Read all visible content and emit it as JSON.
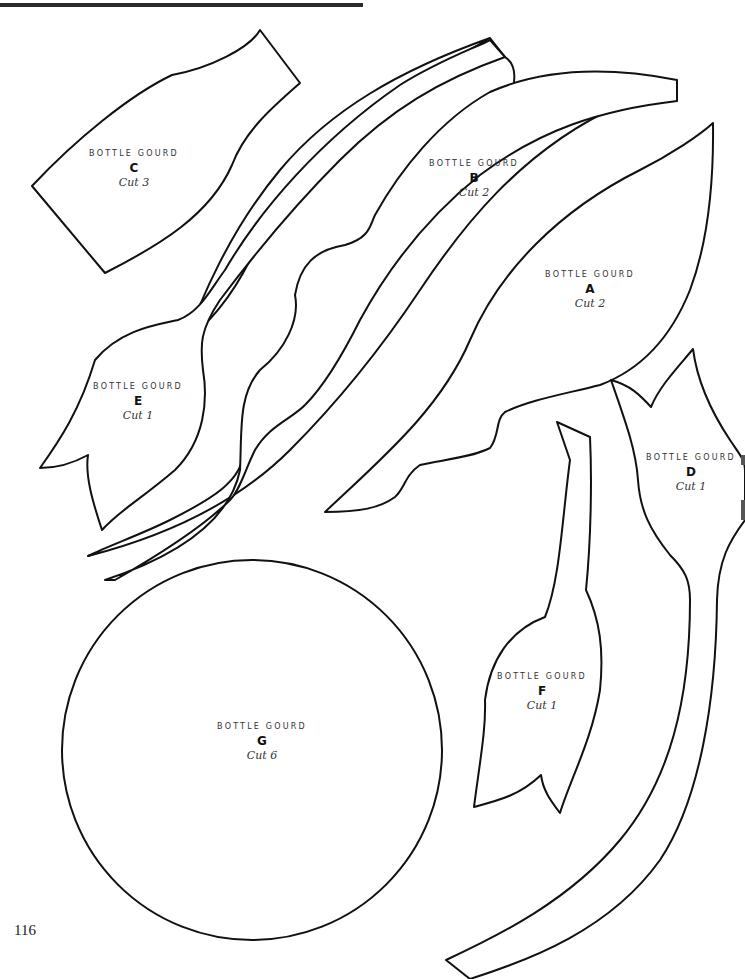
{
  "page": {
    "page_number": "116",
    "rule_color": "#2b2b2b",
    "line_color": "#111111",
    "background": "#ffffff"
  },
  "pieces": [
    {
      "id": "A",
      "title": "BOTTLE GOURD",
      "letter": "A",
      "cut": "Cut 2"
    },
    {
      "id": "B",
      "title": "BOTTLE GOURD",
      "letter": "B",
      "cut": "Cut 2"
    },
    {
      "id": "C",
      "title": "BOTTLE GOURD",
      "letter": "C",
      "cut": "Cut 3"
    },
    {
      "id": "D",
      "title": "BOTTLE GOURD",
      "letter": "D",
      "cut": "Cut 1"
    },
    {
      "id": "E",
      "title": "BOTTLE GOURD",
      "letter": "E",
      "cut": "Cut 1"
    },
    {
      "id": "F",
      "title": "BOTTLE GOURD",
      "letter": "F",
      "cut": "Cut 1"
    },
    {
      "id": "G",
      "title": "BOTTLE GOURD",
      "letter": "G",
      "cut": "Cut 6"
    }
  ]
}
